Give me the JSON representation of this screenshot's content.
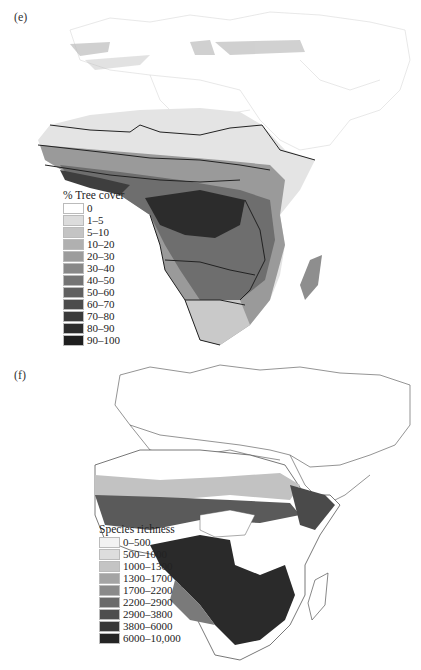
{
  "panel_e": {
    "label": "(e)",
    "legend_title": "% Tree cover",
    "legend": [
      {
        "label": "0",
        "color": "#ffffff"
      },
      {
        "label": "1–5",
        "color": "#dcdcdc"
      },
      {
        "label": "5–10",
        "color": "#c4c4c4"
      },
      {
        "label": "10–20",
        "color": "#b0b0b0"
      },
      {
        "label": "20–30",
        "color": "#9c9c9c"
      },
      {
        "label": "30–40",
        "color": "#888888"
      },
      {
        "label": "40–50",
        "color": "#747474"
      },
      {
        "label": "50–60",
        "color": "#606060"
      },
      {
        "label": "60–70",
        "color": "#4c4c4c"
      },
      {
        "label": "70–80",
        "color": "#3a3a3a"
      },
      {
        "label": "80–90",
        "color": "#2c2c2c"
      },
      {
        "label": "90–100",
        "color": "#1e1e1e"
      }
    ]
  },
  "panel_f": {
    "label": "(f)",
    "legend_title": "Species richness",
    "legend": [
      {
        "label": "0–500",
        "color": "#f2f2f2"
      },
      {
        "label": "500–1000",
        "color": "#dddddd"
      },
      {
        "label": "1000–1300",
        "color": "#c4c4c4"
      },
      {
        "label": "1300–1700",
        "color": "#a4a4a4"
      },
      {
        "label": "1700–2200",
        "color": "#8a8a8a"
      },
      {
        "label": "2200–2900",
        "color": "#6a6a6a"
      },
      {
        "label": "2900–3800",
        "color": "#4e4e4e"
      },
      {
        "label": "3800–6000",
        "color": "#383838"
      },
      {
        "label": "6000–10,000",
        "color": "#242424"
      }
    ]
  }
}
